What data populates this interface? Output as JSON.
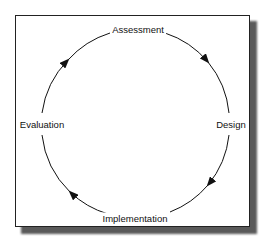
{
  "diagram": {
    "type": "cycle",
    "nodes": [
      {
        "label": "Assessment",
        "x": 138,
        "y": 29
      },
      {
        "label": "Design",
        "x": 231,
        "y": 124
      },
      {
        "label": "Implementation",
        "x": 135,
        "y": 218
      },
      {
        "label": "Evaluation",
        "x": 42,
        "y": 124
      }
    ],
    "edges": [
      {
        "from": "Assessment",
        "to": "Design"
      },
      {
        "from": "Design",
        "to": "Implementation"
      },
      {
        "from": "Implementation",
        "to": "Evaluation"
      },
      {
        "from": "Evaluation",
        "to": "Assessment"
      }
    ],
    "colors": {
      "line": "#111111",
      "frame": "#222222",
      "shadow": "#5a5a5a"
    }
  }
}
